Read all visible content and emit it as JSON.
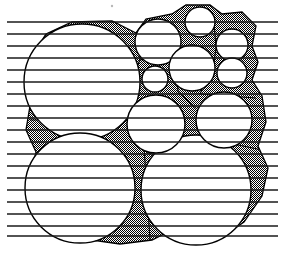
{
  "figure": {
    "width": 285,
    "height": 255,
    "background_color": "#ffffff",
    "line_color": "#000000",
    "shade_color": "#808080",
    "shade_pattern": "50-percent-checkerboard-dither",
    "stroke_width": 1.3
  },
  "speck": {
    "name": "stray-speck",
    "cx": 112,
    "cy": 6,
    "r": 1.2,
    "color": "#b8b8b8"
  },
  "scan_lines": {
    "name": "horizontal-scan-lines",
    "color": "#1a1a1a",
    "thickness": 1.6,
    "x_start": 7,
    "x_end": 278,
    "spacing": 12.1,
    "y_values": [
      22,
      34,
      46,
      58,
      70,
      82,
      94,
      106,
      118,
      130,
      142,
      154,
      166,
      178,
      190,
      202,
      214,
      226,
      236
    ]
  },
  "circles": [
    {
      "id": "big-top-left",
      "label": "Large circle, upper left",
      "cx": 82,
      "cy": 82,
      "r": 58
    },
    {
      "id": "big-bottom-left",
      "label": "Large circle, lower left",
      "cx": 80,
      "cy": 188,
      "r": 55
    },
    {
      "id": "big-bottom-right",
      "label": "Large circle, lower right",
      "cx": 196,
      "cy": 190,
      "r": 55
    },
    {
      "id": "med-top-center",
      "label": "Medium circle, top center",
      "cx": 158,
      "cy": 42,
      "r": 23
    },
    {
      "id": "med-mid-right",
      "label": "Medium circle, mid right",
      "cx": 192,
      "cy": 68,
      "r": 23
    },
    {
      "id": "med-center",
      "label": "Medium circle, center",
      "cx": 156,
      "cy": 124,
      "r": 29
    },
    {
      "id": "med-right",
      "label": "Medium circle, right",
      "cx": 224,
      "cy": 120,
      "r": 28
    },
    {
      "id": "small-center",
      "label": "Small circle, center",
      "cx": 155,
      "cy": 79,
      "r": 13
    },
    {
      "id": "small-top-right",
      "label": "Small circle, top right",
      "cx": 200,
      "cy": 22,
      "r": 15
    },
    {
      "id": "small-edge-upper",
      "label": "Small circle, right edge upper",
      "cx": 232,
      "cy": 45,
      "r": 16
    },
    {
      "id": "small-edge-lower",
      "label": "Small circle, right edge lower",
      "cx": 232,
      "cy": 73,
      "r": 15
    }
  ],
  "void_regions": {
    "name": "interstitial-void-shading",
    "description": "Gray dithered bands filling the gaps between adjacent circles and the polygonal cell boundary",
    "count": 1
  },
  "cell_boundary": {
    "name": "polygonal-cell-boundary",
    "description": "Outer polygonal envelope enclosing the packed circles"
  }
}
